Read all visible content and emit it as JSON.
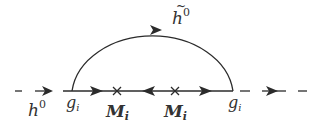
{
  "diagram": {
    "type": "feynman-diagram",
    "colors": {
      "line": "#2b2b2b",
      "text": "#333333",
      "background": "#ffffff"
    },
    "external_lines": [
      {
        "id": "left",
        "style": "dashed",
        "particle": "h^0",
        "direction": "right"
      },
      {
        "id": "right",
        "style": "dashed",
        "direction": "right"
      }
    ],
    "internal_lines": [
      {
        "id": "arc",
        "style": "solid",
        "particle": "h-tilde^0",
        "direction": "right"
      },
      {
        "id": "fermion-segment-1",
        "style": "solid",
        "direction": "right"
      },
      {
        "id": "fermion-segment-2",
        "style": "solid",
        "direction": "left"
      },
      {
        "id": "fermion-segment-3",
        "style": "solid",
        "direction": "right"
      }
    ],
    "vertices": [
      {
        "id": "left-vertex",
        "label_base": "g",
        "label_sub": "i"
      },
      {
        "id": "right-vertex",
        "label_base": "g",
        "label_sub": "i"
      }
    ],
    "mass_insertions": [
      {
        "id": "mass-1",
        "label_base": "M",
        "label_sub": "i"
      },
      {
        "id": "mass-2",
        "label_base": "M",
        "label_sub": "i"
      }
    ],
    "labels": {
      "h0_base": "h",
      "h0_sup": "0",
      "htilde_base": "h",
      "htilde_tilde": "~",
      "htilde_sup": "0",
      "g_left_base": "g",
      "g_left_sub": "i",
      "g_right_base": "g",
      "g_right_sub": "i",
      "m1_base": "M",
      "m1_sub": "i",
      "m2_base": "M",
      "m2_sub": "i"
    }
  }
}
